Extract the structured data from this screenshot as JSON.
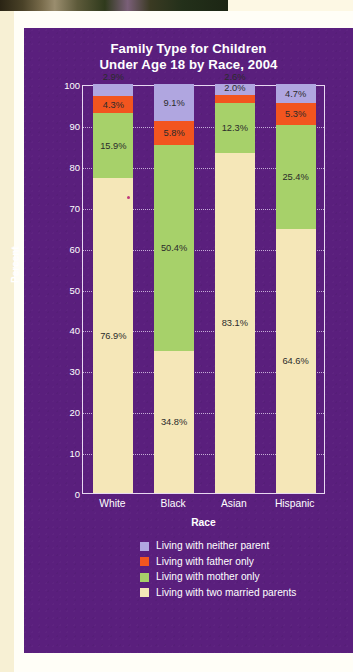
{
  "chart_data": {
    "type": "bar",
    "subtype": "stacked-bar-100",
    "title": "Family Type for Children Under Age 18 by Race, 2004",
    "title_line1": "Family Type for Children",
    "title_line2": "Under Age 18 by Race, 2004",
    "xlabel": "Race",
    "ylabel": "Percent",
    "categories": [
      "White",
      "Black",
      "Asian",
      "Hispanic"
    ],
    "ylim": [
      0,
      100
    ],
    "yticks": [
      0,
      10,
      20,
      30,
      40,
      50,
      60,
      70,
      80,
      90,
      100
    ],
    "grid": true,
    "legend_position": "bottom",
    "series": [
      {
        "name": "Living with two married parents",
        "color": "#f5e7b8",
        "values": [
          76.9,
          34.8,
          83.1,
          64.6
        ],
        "labels": [
          "76.9%",
          "34.8%",
          "83.1%",
          "64.6%"
        ]
      },
      {
        "name": "Living with mother only",
        "color": "#a7d16a",
        "values": [
          15.9,
          50.4,
          12.3,
          25.4
        ],
        "labels": [
          "15.9%",
          "50.4%",
          "12.3%",
          "25.4%"
        ]
      },
      {
        "name": "Living with father only",
        "color": "#f2551f",
        "values": [
          4.3,
          5.8,
          2.0,
          5.3
        ],
        "labels": [
          "4.3%",
          "5.8%",
          "2.0%",
          "5.3%"
        ]
      },
      {
        "name": "Living with neither parent",
        "color": "#b0a6e0",
        "values": [
          2.9,
          9.1,
          2.6,
          4.7
        ],
        "labels": [
          "2.9%",
          "9.1%",
          "2.6%",
          "4.7%"
        ]
      }
    ]
  },
  "legend": {
    "items": [
      {
        "label": "Living with neither parent",
        "color": "#b0a6e0"
      },
      {
        "label": "Living with father only",
        "color": "#f2551f"
      },
      {
        "label": "Living with mother only",
        "color": "#a7d16a"
      },
      {
        "label": "Living with two married parents",
        "color": "#f5e7b8"
      }
    ]
  },
  "theme": {
    "panel_background": "#5a1f7d",
    "page_background": "#fffef7",
    "cream_margin": "#f7f0d4",
    "axis_color": "#e8d8f2",
    "text_on_panel": "#ffffff",
    "label_text": "#2b2b2b"
  }
}
